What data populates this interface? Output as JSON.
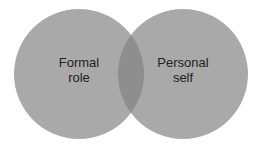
{
  "diagram": {
    "type": "venn",
    "circles": [
      {
        "id": "formal-role",
        "label_line1": "Formal",
        "label_line2": "role",
        "cx": 79,
        "cy": 74,
        "r": 65
      },
      {
        "id": "personal-self",
        "label_line1": "Personal",
        "label_line2": "self",
        "cx": 183,
        "cy": 74,
        "r": 65
      }
    ],
    "colors": {
      "circle_fill": "#a9a9a9",
      "overlap_fill": "#8e8e8e",
      "text": "#222222",
      "background": "#ffffff"
    }
  }
}
